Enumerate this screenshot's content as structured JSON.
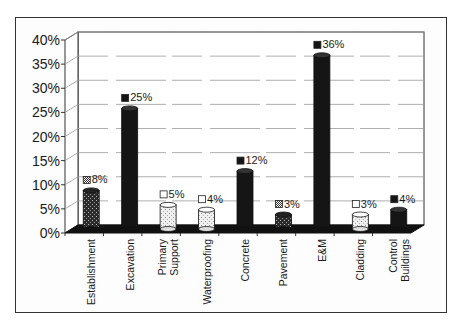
{
  "chart_data": {
    "type": "bar",
    "title": "",
    "xlabel": "",
    "ylabel": "",
    "categories": [
      "Establishment",
      "Excavation",
      "Primary Support",
      "Waterproofing",
      "Concrete",
      "Pavement",
      "E&M",
      "Cladding",
      "Control Buildings"
    ],
    "values": [
      8,
      25,
      5,
      4,
      12,
      3,
      36,
      3,
      4
    ],
    "value_labels": [
      "8%",
      "25%",
      "5%",
      "4%",
      "12%",
      "3%",
      "36%",
      "3%",
      "4%"
    ],
    "bar_styles": [
      "pattern",
      "black",
      "white",
      "white",
      "black",
      "pattern",
      "black",
      "white",
      "black"
    ],
    "ylim": [
      0,
      40
    ],
    "y_ticks": [
      "0%",
      "5%",
      "10%",
      "15%",
      "20%",
      "25%",
      "30%",
      "35%",
      "40%"
    ],
    "grid": true,
    "legend": "none",
    "style": "3d-cylinder"
  },
  "colors": {
    "black_bar": "#151515",
    "white_bar": "#f2f2f2",
    "pattern_bar": "#3a3a3a",
    "floor": "#111111",
    "grid": "#9a9a9a",
    "axis": "#333333"
  }
}
